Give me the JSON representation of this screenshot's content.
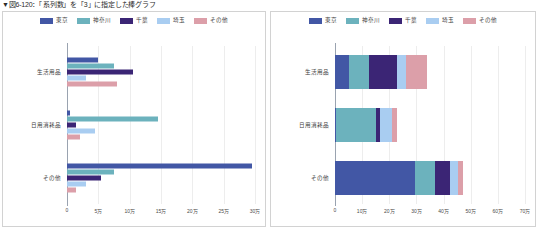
{
  "caption": "▼図6-120：「系列数」を「3」に指定した棒グラフ",
  "colors": {
    "tokyo": "#4257a5",
    "kanagawa": "#6cb2bd",
    "chiba": "#3b2575",
    "saitama": "#a9cdf1",
    "sonota": "#dc9fa9",
    "gridline": "#ededed",
    "axis": "#9aa3b0",
    "panel_border": "#d2d2d2",
    "text": "#3d3d3d"
  },
  "legend": {
    "items": [
      {
        "label": "東京",
        "key": "tokyo"
      },
      {
        "label": "神奈川",
        "key": "kanagawa"
      },
      {
        "label": "千葉",
        "key": "chiba"
      },
      {
        "label": "埼玉",
        "key": "saitama"
      },
      {
        "label": "その他",
        "key": "sonota"
      }
    ]
  },
  "chart_data": [
    {
      "id": "left-chart",
      "type": "bar",
      "orientation": "horizontal",
      "grouping": "clustered",
      "title": "",
      "xlabel": "",
      "ylabel": "",
      "categories": [
        "生活用品",
        "日用消耗品",
        "その他"
      ],
      "series": [
        {
          "name": "東京",
          "values": [
            50000,
            5000,
            295000
          ]
        },
        {
          "name": "神奈川",
          "values": [
            75000,
            145000,
            75000
          ]
        },
        {
          "name": "千葉",
          "values": [
            105000,
            15000,
            55000
          ]
        },
        {
          "name": "埼玉",
          "values": [
            30000,
            45000,
            30000
          ]
        },
        {
          "name": "その他",
          "values": [
            80000,
            20000,
            15000
          ]
        }
      ],
      "xlim": [
        0,
        300000
      ],
      "xticks": [
        0,
        50000,
        100000,
        150000,
        200000,
        250000,
        300000
      ],
      "xticklabels": [
        "0",
        "5万",
        "10万",
        "15万",
        "20万",
        "25万",
        "30万"
      ],
      "grid": true,
      "legend_position": "top"
    },
    {
      "id": "right-chart",
      "type": "bar",
      "orientation": "horizontal",
      "grouping": "stacked",
      "title": "",
      "xlabel": "",
      "ylabel": "",
      "categories": [
        "生活用品",
        "日用消耗品",
        "その他"
      ],
      "series": [
        {
          "name": "東京",
          "values": [
            50000,
            5000,
            295000
          ]
        },
        {
          "name": "神奈川",
          "values": [
            75000,
            145000,
            75000
          ]
        },
        {
          "name": "千葉",
          "values": [
            105000,
            15000,
            55000
          ]
        },
        {
          "name": "埼玉",
          "values": [
            30000,
            45000,
            30000
          ]
        },
        {
          "name": "その他",
          "values": [
            80000,
            20000,
            15000
          ]
        }
      ],
      "totals": [
        340000,
        230000,
        470000
      ],
      "xlim": [
        0,
        700000
      ],
      "xticks": [
        0,
        100000,
        200000,
        300000,
        400000,
        500000,
        600000,
        700000
      ],
      "xticklabels": [
        "0",
        "10万",
        "20万",
        "30万",
        "40万",
        "50万",
        "60万",
        "70万"
      ],
      "grid": true,
      "legend_position": "top"
    }
  ]
}
